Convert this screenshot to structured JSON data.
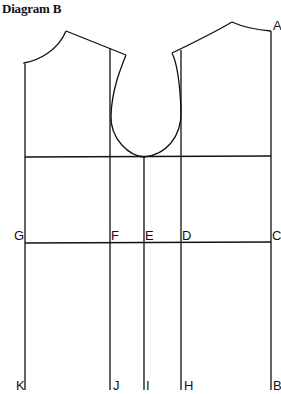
{
  "title": "Diagram B",
  "colors": {
    "line": "#111111",
    "background": "#ffffff"
  },
  "labels": {
    "A": "A",
    "B": "B",
    "C": "C",
    "D": "D",
    "E": "E",
    "F": "F",
    "G": "G",
    "H": "H",
    "I": "I",
    "J": "J",
    "K": "K"
  }
}
